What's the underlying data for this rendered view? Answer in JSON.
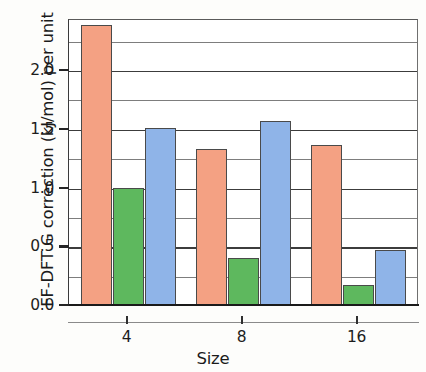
{
  "chart_data": {
    "type": "bar",
    "title": "",
    "xlabel": "Size",
    "ylabel": "FF-DFT G correction (kJ/mol) per unit",
    "categories": [
      "4",
      "8",
      "16"
    ],
    "series": [
      {
        "name": "series-1",
        "color": "#f4a183",
        "values": [
          2.38,
          1.33,
          1.36
        ]
      },
      {
        "name": "series-2",
        "color": "#5eb85e",
        "values": [
          1.0,
          0.4,
          0.17
        ]
      },
      {
        "name": "series-3",
        "color": "#8fb4e8",
        "values": [
          1.51,
          1.57,
          0.47
        ]
      }
    ],
    "ylim": [
      0.0,
      2.44
    ],
    "yticks": [
      "0.0",
      "0.5",
      "1.0",
      "1.5",
      "2.0"
    ],
    "ytick_values": [
      0.0,
      0.5,
      1.0,
      1.5,
      2.0
    ],
    "gridlines": [
      0.25,
      0.5,
      0.75,
      1.0,
      1.25,
      1.5,
      1.75,
      2.0,
      2.25
    ],
    "major_gridlines": [
      0.5,
      1.0,
      1.5,
      2.0
    ],
    "grid": true,
    "legend": "none",
    "legend_position": "none",
    "bar_border_color": "#4a4a4a"
  }
}
